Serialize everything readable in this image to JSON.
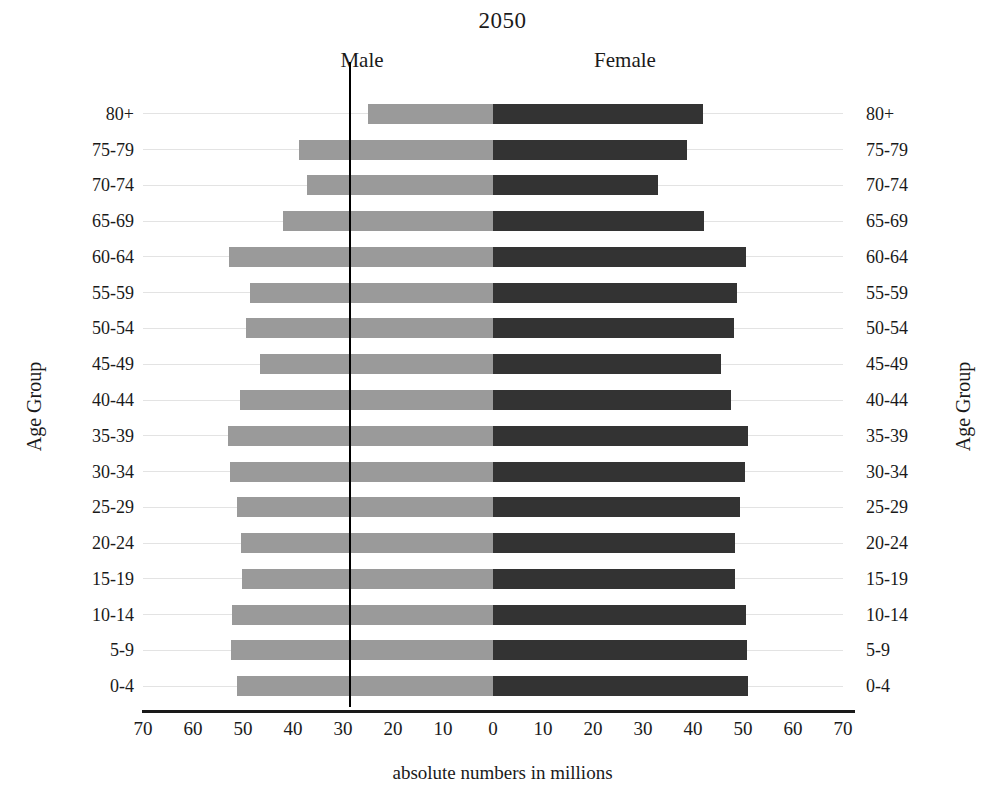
{
  "chart_data": {
    "type": "bar",
    "subtype": "population-pyramid",
    "title": "2050",
    "xlabel": "absolute numbers in millions",
    "ylabel": "Age Group",
    "ylabel_right": "Age Group",
    "grid": true,
    "legend_position": "top-inline",
    "xlim": [
      -70,
      70
    ],
    "x_ticks": [
      "70",
      "60",
      "50",
      "40",
      "30",
      "20",
      "10",
      "0",
      "10",
      "20",
      "30",
      "40",
      "50",
      "60",
      "70"
    ],
    "x_tick_values": [
      -70,
      -60,
      -50,
      -40,
      -30,
      -20,
      -10,
      0,
      10,
      20,
      30,
      40,
      50,
      60,
      70
    ],
    "categories": [
      "80+",
      "75-79",
      "70-74",
      "65-69",
      "60-64",
      "55-59",
      "50-54",
      "45-49",
      "40-44",
      "35-39",
      "30-34",
      "25-29",
      "20-24",
      "15-19",
      "10-14",
      "5-9",
      "0-4"
    ],
    "series": [
      {
        "name": "Male",
        "side": "left",
        "color": "#9a9a9a",
        "values": [
          25.0,
          38.8,
          37.2,
          42.0,
          52.8,
          48.6,
          49.4,
          46.6,
          50.6,
          53.0,
          52.6,
          51.2,
          50.4,
          50.2,
          52.2,
          52.4,
          51.2
        ]
      },
      {
        "name": "Female",
        "side": "right",
        "color": "#333333",
        "values": [
          42.0,
          38.8,
          33.0,
          42.2,
          50.6,
          48.8,
          48.2,
          45.6,
          47.6,
          51.0,
          50.4,
          49.4,
          48.4,
          48.4,
          50.6,
          50.8,
          51.0
        ]
      }
    ]
  },
  "labels": {
    "male": "Male",
    "female": "Female"
  }
}
